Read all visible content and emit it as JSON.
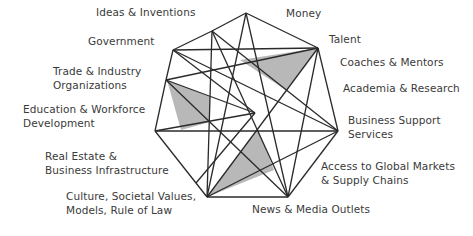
{
  "diagram": {
    "type": "network",
    "line_color": "#2a2a2a",
    "fill_color": "#b8b8b8",
    "labels": [
      {
        "id": "ideas",
        "text": "Ideas & Inventions",
        "x": 96,
        "y": 11
      },
      {
        "id": "money",
        "text": "Money",
        "x": 286,
        "y": 12
      },
      {
        "id": "government",
        "text": "Government",
        "x": 88,
        "y": 40
      },
      {
        "id": "talent",
        "text": "Talent",
        "x": 329,
        "y": 38
      },
      {
        "id": "coaches",
        "text": "Coaches & Mentors",
        "x": 340,
        "y": 61
      },
      {
        "id": "trade1",
        "text": "Trade & Industry",
        "x": 53,
        "y": 70
      },
      {
        "id": "trade2",
        "text": "Organizations",
        "x": 53,
        "y": 84
      },
      {
        "id": "academia",
        "text": "Academia & Research",
        "x": 343,
        "y": 87
      },
      {
        "id": "edu1",
        "text": "Education & Workforce",
        "x": 23,
        "y": 108
      },
      {
        "id": "edu2",
        "text": "Development",
        "x": 23,
        "y": 122
      },
      {
        "id": "bss1",
        "text": "Business Support",
        "x": 348,
        "y": 119
      },
      {
        "id": "bss2",
        "text": "Services",
        "x": 348,
        "y": 133
      },
      {
        "id": "re1",
        "text": "Real Estate &",
        "x": 45,
        "y": 155
      },
      {
        "id": "re2",
        "text": "Business Infrastructure",
        "x": 45,
        "y": 169
      },
      {
        "id": "access1",
        "text": "Access to Global Markets",
        "x": 321,
        "y": 165
      },
      {
        "id": "access2",
        "text": "& Supply Chains",
        "x": 321,
        "y": 179
      },
      {
        "id": "culture1",
        "text": "Culture, Societal Values,",
        "x": 66,
        "y": 195
      },
      {
        "id": "culture2",
        "text": "Models, Rule of Law",
        "x": 66,
        "y": 209
      },
      {
        "id": "news",
        "text": "News & Media Outlets",
        "x": 252,
        "y": 208
      }
    ],
    "nodes": {
      "top": [
        246,
        13
      ],
      "ideas": [
        212,
        31
      ],
      "gov": [
        173,
        50
      ],
      "trade": [
        166,
        80
      ],
      "left": [
        155,
        131
      ],
      "culture": [
        207,
        197
      ],
      "news": [
        288,
        197
      ],
      "bss": [
        338,
        131
      ],
      "talent": [
        318,
        48
      ],
      "inA": [
        255,
        113
      ],
      "inB": [
        196,
        183
      ]
    },
    "edges": [
      [
        "top",
        "talent"
      ],
      [
        "top",
        "ideas"
      ],
      [
        "ideas",
        "gov"
      ],
      [
        "gov",
        "trade"
      ],
      [
        "trade",
        "left"
      ],
      [
        "left",
        "culture"
      ],
      [
        "culture",
        "news"
      ],
      [
        "news",
        "bss"
      ],
      [
        "bss",
        "talent"
      ],
      [
        "gov",
        "talent"
      ],
      [
        "trade",
        "talent"
      ],
      [
        "left",
        "bss"
      ],
      [
        "ideas",
        "bss"
      ],
      [
        "ideas",
        "culture"
      ],
      [
        "ideas",
        "news"
      ],
      [
        "top",
        "culture"
      ],
      [
        "gov",
        "inA"
      ],
      [
        "trade",
        "inA"
      ],
      [
        "inA",
        "inB"
      ],
      [
        "talent",
        "culture"
      ],
      [
        "bss",
        "culture"
      ],
      [
        "top",
        "news"
      ],
      [
        "talent",
        "news"
      ],
      [
        "gov",
        "bss"
      ],
      [
        "trade",
        "news"
      ],
      [
        "inA",
        "left"
      ]
    ],
    "shaded": [
      [
        [
          167,
          80
        ],
        [
          210,
          97
        ],
        [
          210,
          122
        ],
        [
          181,
          130
        ]
      ],
      [
        [
          240,
          60
        ],
        [
          318,
          48
        ],
        [
          286,
          90
        ]
      ],
      [
        [
          258,
          129
        ],
        [
          207,
          197
        ],
        [
          274,
          170
        ]
      ]
    ]
  }
}
